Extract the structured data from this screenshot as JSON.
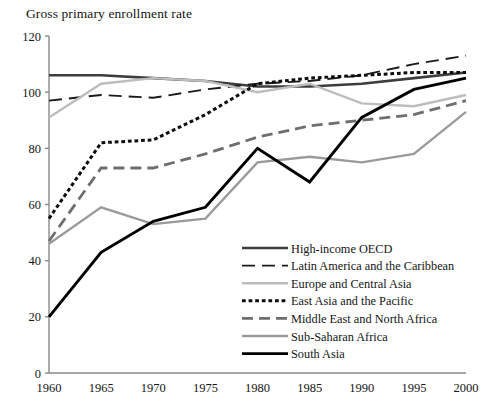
{
  "chart_data": {
    "type": "line",
    "title": "Gross primary enrollment rate",
    "xlabel": "",
    "ylabel": "",
    "x": [
      1960,
      1965,
      1970,
      1975,
      1980,
      1985,
      1990,
      1995,
      2000
    ],
    "xtick_labels": [
      "1960",
      "1965",
      "1970",
      "1975",
      "1980",
      "1985",
      "1990",
      "1995",
      "2000"
    ],
    "ytick_labels": [
      "0",
      "20",
      "40",
      "60",
      "80",
      "100",
      "120"
    ],
    "yticks": [
      0,
      20,
      40,
      60,
      80,
      100,
      120
    ],
    "xlim": [
      1960,
      2000
    ],
    "ylim": [
      0,
      120
    ],
    "grid": false,
    "legend_position": "inside-lower-right",
    "series": [
      {
        "name": "High-income OECD",
        "values": [
          106,
          106,
          105,
          104,
          102,
          102,
          103,
          105,
          107
        ],
        "color": "#3d3d3d",
        "style": "solid",
        "width": 2.6
      },
      {
        "name": "Latin America and the Caribbean",
        "values": [
          97,
          99,
          98,
          101,
          103,
          104,
          106,
          110,
          113
        ],
        "color": "#1a1a1a",
        "style": "longdash",
        "width": 1.9
      },
      {
        "name": "Europe and Central Asia",
        "values": [
          91,
          103,
          105,
          104,
          100,
          103,
          96,
          95,
          99
        ],
        "color": "#bdbdbd",
        "style": "solid",
        "width": 2.4
      },
      {
        "name": "East Asia and the Pacific",
        "values": [
          55,
          82,
          83,
          92,
          103,
          105,
          106,
          107,
          107
        ],
        "color": "#0d0d0d",
        "style": "dotted",
        "width": 3.0
      },
      {
        "name": "Middle East and North Africa",
        "values": [
          47,
          73,
          73,
          78,
          84,
          88,
          90,
          92,
          97
        ],
        "color": "#6e6e6e",
        "style": "dash",
        "width": 2.8
      },
      {
        "name": "Sub-Saharan Africa",
        "values": [
          46,
          59,
          53,
          55,
          75,
          77,
          75,
          78,
          93
        ],
        "color": "#9a9a9a",
        "style": "solid",
        "width": 2.3
      },
      {
        "name": "South Asia",
        "values": [
          20,
          43,
          54,
          59,
          80,
          68,
          91,
          101,
          105
        ],
        "color": "#000000",
        "style": "solid",
        "width": 2.9
      }
    ]
  },
  "legend": {
    "items": [
      {
        "label": "High-income OECD"
      },
      {
        "label": "Latin America and the Caribbean"
      },
      {
        "label": "Europe and Central Asia"
      },
      {
        "label": "East Asia and the Pacific"
      },
      {
        "label": "Middle East and North Africa"
      },
      {
        "label": "Sub-Saharan Africa"
      },
      {
        "label": "South Asia"
      }
    ]
  }
}
